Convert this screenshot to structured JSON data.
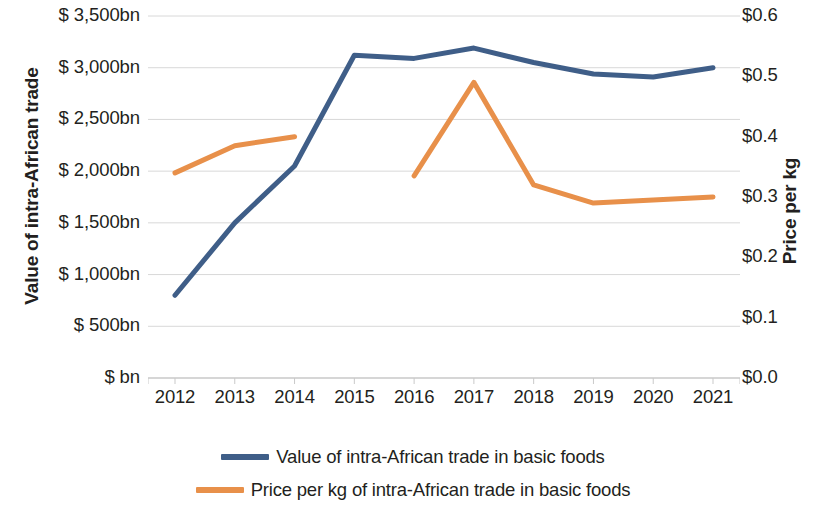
{
  "chart_data": {
    "type": "line",
    "title": "",
    "xlabel": "",
    "x": [
      "2012",
      "2013",
      "2014",
      "2015",
      "2016",
      "2017",
      "2018",
      "2019",
      "2020",
      "2021"
    ],
    "grid": true,
    "legend_position": "bottom",
    "axes": {
      "left": {
        "label": "Value of intra-African trade",
        "ticks": [
          "$ bn",
          "$ 500bn",
          "$ 1,000bn",
          "$ 1,500bn",
          "$ 2,000bn",
          "$ 2,500bn",
          "$ 3,000bn",
          "$ 3,500bn"
        ],
        "tick_values": [
          0,
          500,
          1000,
          1500,
          2000,
          2500,
          3000,
          3500
        ],
        "ylim": [
          0,
          3500
        ]
      },
      "right": {
        "label": "Price per kg",
        "ticks": [
          "$0.0",
          "$0.1",
          "$0.2",
          "$0.3",
          "$0.4",
          "$0.5",
          "$0.6"
        ],
        "tick_values": [
          0.0,
          0.1,
          0.2,
          0.3,
          0.4,
          0.5,
          0.6
        ],
        "ylim": [
          0,
          0.6
        ]
      }
    },
    "series": [
      {
        "name": "Value of intra-African trade in basic foods",
        "axis": "left",
        "color": "#3f5e88",
        "values": [
          800,
          1500,
          2050,
          3120,
          3090,
          3190,
          3050,
          2940,
          2910,
          3000
        ]
      },
      {
        "name": "Price per kg of intra-African trade in basic foods",
        "axis": "right",
        "color": "#e8904a",
        "values": [
          0.34,
          0.385,
          0.4,
          null,
          0.335,
          0.49,
          0.32,
          0.29,
          0.295,
          0.3
        ]
      }
    ]
  },
  "legend": {
    "items": [
      {
        "label": "Value of intra-African trade in basic foods",
        "color": "#3f5e88"
      },
      {
        "label": "Price per kg of intra-African trade in basic foods",
        "color": "#e8904a"
      }
    ]
  },
  "colors": {
    "series_blue": "#3f5e88",
    "series_orange": "#e8904a",
    "grid": "#d8d8d8",
    "text": "#231f20",
    "background": "#ffffff"
  }
}
